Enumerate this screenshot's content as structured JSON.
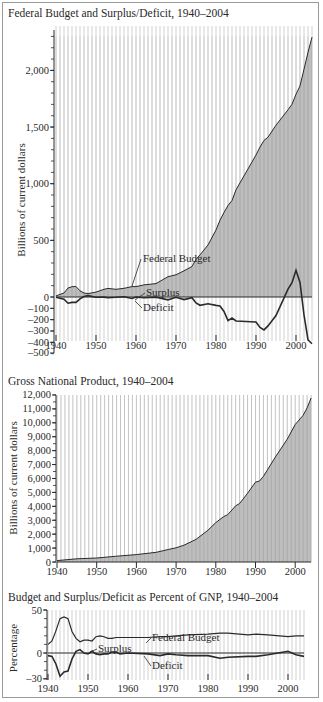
{
  "chart_data": [
    {
      "type": "area",
      "title": "Federal Budget and Surplus/Deficit, 1940–2004",
      "xlabel": "",
      "ylabel": "Billions of current dollars",
      "xlim": [
        1940,
        2004
      ],
      "ylim": [
        -500,
        2300
      ],
      "yticks": [
        -500,
        -400,
        -300,
        -200,
        -100,
        0,
        500,
        1000,
        1500,
        2000
      ],
      "ytick_labels": [
        "–500",
        "–400",
        "–300",
        "–200",
        "–100",
        "0",
        "500",
        "1,000",
        "1,500",
        "2,000"
      ],
      "xticks": [
        1940,
        1950,
        1960,
        1970,
        1980,
        1990,
        2000
      ],
      "grid": "vertical lines every year",
      "annotations": [
        "Federal Budget",
        "Surplus",
        "Deficit"
      ],
      "x": [
        1940,
        1942,
        1943,
        1944,
        1945,
        1946,
        1947,
        1948,
        1950,
        1952,
        1953,
        1955,
        1957,
        1959,
        1960,
        1962,
        1965,
        1968,
        1970,
        1972,
        1974,
        1975,
        1976,
        1978,
        1980,
        1981,
        1982,
        1983,
        1984,
        1985,
        1990,
        1991,
        1992,
        1993,
        1995,
        1998,
        1999,
        2000,
        2001,
        2002,
        2003,
        2004
      ],
      "series": [
        {
          "name": "Federal Budget",
          "values": [
            10,
            35,
            79,
            91,
            93,
            55,
            35,
            30,
            43,
            68,
            76,
            68,
            77,
            92,
            92,
            107,
            118,
            179,
            196,
            231,
            269,
            332,
            372,
            459,
            591,
            678,
            746,
            808,
            852,
            946,
            1253,
            1324,
            1382,
            1410,
            1516,
            1652,
            1702,
            1789,
            1863,
            2011,
            2160,
            2293
          ]
        },
        {
          "name": "Surplus/Deficit",
          "values": [
            -3,
            -20,
            -55,
            -48,
            -48,
            -16,
            4,
            12,
            -3,
            -1,
            -6,
            -3,
            3,
            -13,
            0,
            -7,
            -1,
            -25,
            -3,
            -23,
            -6,
            -53,
            -73,
            -59,
            -74,
            -79,
            -128,
            -208,
            -185,
            -212,
            -221,
            -269,
            -290,
            -255,
            -164,
            69,
            126,
            236,
            128,
            -158,
            -378,
            -412
          ]
        }
      ]
    },
    {
      "type": "area",
      "title": "Gross National Product, 1940–2004",
      "xlabel": "",
      "ylabel": "Billions of current dollars",
      "xlim": [
        1940,
        2004
      ],
      "ylim": [
        0,
        12000
      ],
      "yticks": [
        0,
        1000,
        2000,
        3000,
        4000,
        5000,
        6000,
        7000,
        8000,
        9000,
        10000,
        11000,
        12000
      ],
      "ytick_labels": [
        "0",
        "1,000",
        "2,000",
        "3,000",
        "4,000",
        "5,000",
        "6,000",
        "7,000",
        "8,000",
        "9,000",
        "10,000",
        "11,000",
        "12,000"
      ],
      "xticks": [
        1940,
        1950,
        1960,
        1970,
        1980,
        1990,
        2000
      ],
      "grid": "vertical lines every year",
      "x": [
        1940,
        1945,
        1950,
        1955,
        1960,
        1965,
        1968,
        1970,
        1972,
        1975,
        1978,
        1980,
        1982,
        1983,
        1985,
        1986,
        1988,
        1990,
        1991,
        1992,
        1995,
        1998,
        2000,
        2002,
        2003,
        2004
      ],
      "series": [
        {
          "name": "GNP",
          "values": [
            100,
            230,
            290,
            420,
            530,
            700,
            900,
            1020,
            1210,
            1620,
            2280,
            2830,
            3260,
            3400,
            4040,
            4200,
            4940,
            5740,
            5820,
            6150,
            7540,
            8830,
            9880,
            10530,
            11070,
            11780
          ]
        }
      ]
    },
    {
      "type": "line",
      "title": "Budget and Surplus/Deficit as Percent of GNP, 1940–2004",
      "xlabel": "",
      "ylabel": "Percentage",
      "xlim": [
        1940,
        2004
      ],
      "ylim": [
        -30,
        50
      ],
      "yticks": [
        -30,
        0,
        50
      ],
      "ytick_labels": [
        "–30",
        "0",
        "50"
      ],
      "xticks": [
        1940,
        1950,
        1960,
        1970,
        1980,
        1990,
        2000
      ],
      "grid": "vertical lines every year",
      "annotations": [
        "Federal Budget",
        "Surplus",
        "Deficit"
      ],
      "x": [
        1940,
        1941,
        1942,
        1943,
        1944,
        1945,
        1946,
        1947,
        1948,
        1949,
        1950,
        1951,
        1952,
        1953,
        1954,
        1955,
        1956,
        1957,
        1958,
        1960,
        1965,
        1968,
        1970,
        1972,
        1975,
        1980,
        1983,
        1985,
        1990,
        1992,
        1995,
        2000,
        2002,
        2004
      ],
      "series": [
        {
          "name": "Federal Budget",
          "values": [
            10,
            14,
            26,
            40,
            42,
            40,
            25,
            17,
            13,
            15,
            15,
            14,
            19,
            20,
            19,
            17,
            17,
            18,
            18,
            18,
            18,
            19,
            19,
            20,
            21,
            22,
            23,
            23,
            21,
            22,
            21,
            19,
            20,
            20
          ]
        },
        {
          "name": "Surplus/Deficit",
          "values": [
            -3,
            -4,
            -13,
            -27,
            -22,
            -21,
            -7,
            2,
            4,
            0,
            -1,
            2,
            -1,
            -2,
            -1,
            -1,
            1,
            1,
            -1,
            0,
            -1,
            -3,
            -1,
            -2,
            -3,
            -3,
            -6,
            -5,
            -4,
            -4,
            -2,
            2,
            -2,
            -4
          ]
        }
      ]
    }
  ],
  "charts": {
    "c1": {
      "title": "Federal Budget and Surplus/Deficit, 1940–2004",
      "ylabel": "Billions of current dollars",
      "labels": {
        "budget": "Federal Budget",
        "surplus": "Surplus",
        "deficit": "Deficit"
      }
    },
    "c2": {
      "title": "Gross National Product, 1940–2004",
      "ylabel": "Billions of current dollars"
    },
    "c3": {
      "title": "Budget and Surplus/Deficit as Percent of GNP, 1940–2004",
      "ylabel": "Percentage",
      "labels": {
        "budget": "Federal Budget",
        "surplus": "Surplus",
        "deficit": "Deficit"
      }
    },
    "xtick_labels": [
      "1940",
      "1950",
      "1960",
      "1970",
      "1980",
      "1990",
      "2000"
    ]
  },
  "colors": {
    "fill": "#a8a8a8",
    "line": "#2a2a2a",
    "grid": "#bdbdbd",
    "frame": "#9a9a9a"
  }
}
